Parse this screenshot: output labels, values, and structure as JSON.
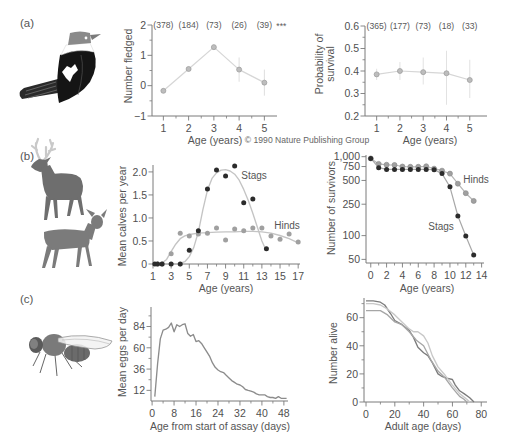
{
  "figure": {
    "panels": {
      "a": {
        "label": "(a)",
        "illustration": "bird-icon"
      },
      "b": {
        "label": "(b)",
        "illustration": "deer-icon"
      },
      "c": {
        "label": "(c)",
        "illustration": "fruit-fly-icon"
      }
    },
    "copyright": "© 1990 Nature Publishing Group"
  },
  "chart_data": [
    {
      "id": "a1",
      "panel": "(a)",
      "type": "line",
      "title": "",
      "xlabel": "Age (years)",
      "ylabel": "Number fledged",
      "xlim": [
        0.55,
        5.5
      ],
      "ylim": [
        -1,
        2
      ],
      "grid": false,
      "xticks": [
        1,
        2,
        3,
        4,
        5
      ],
      "xtick_labels": [
        "1",
        "2",
        "3",
        "4",
        "5"
      ],
      "xticks_minor": [
        1.5,
        2.5,
        3.5,
        4.5
      ],
      "yticks": [
        -1,
        0,
        1,
        2
      ],
      "ytick_labels": [
        "−1",
        "0",
        "1",
        "2"
      ],
      "yticks_minor": [
        -0.5,
        0.5,
        1.5
      ],
      "series": [
        {
          "name": "Number fledged",
          "mode": "line+markers",
          "x": [
            1,
            2,
            3,
            4,
            5
          ],
          "values": [
            -0.17,
            0.55,
            1.27,
            0.53,
            0.1
          ],
          "err_low": [
            -0.24,
            0.48,
            1.18,
            0.13,
            -0.33
          ],
          "err_high": [
            -0.1,
            0.62,
            1.36,
            0.93,
            0.53
          ],
          "color": "#d6d6d6",
          "marker_color": "#bdbdbd",
          "marker_edge": "#9a9a9a",
          "err_color": "#dedede"
        }
      ],
      "annotations": {
        "sample_sizes": [
          "(378)",
          "(184)",
          "(73)",
          "(26)",
          "(39)"
        ],
        "significance": "***"
      }
    },
    {
      "id": "a2",
      "panel": "(a)",
      "type": "line",
      "title": "",
      "xlabel": "Age (years)",
      "ylabel": "Probability of\nsurvival",
      "xlim": [
        0.5,
        5.74
      ],
      "ylim": [
        0.2,
        0.6
      ],
      "grid": false,
      "xticks": [
        1,
        2,
        3,
        4,
        5
      ],
      "xtick_labels": [
        "1",
        "2",
        "3",
        "4",
        "5"
      ],
      "xticks_minor": [
        1.5,
        2.5,
        3.5,
        4.5
      ],
      "yticks": [
        0.2,
        0.3,
        0.4,
        0.5,
        0.6
      ],
      "ytick_labels": [
        "0.2",
        "0.3",
        "0.4",
        "0.5",
        "0.6"
      ],
      "yticks_minor": [
        0.25,
        0.35,
        0.45,
        0.55
      ],
      "series": [
        {
          "name": "Probability of survival",
          "mode": "line+markers",
          "x": [
            1,
            2,
            3,
            4,
            5
          ],
          "values": [
            0.385,
            0.4,
            0.395,
            0.39,
            0.36
          ],
          "err_low": [
            0.36,
            0.36,
            0.34,
            0.25,
            0.28
          ],
          "err_high": [
            0.41,
            0.44,
            0.46,
            0.49,
            0.45
          ],
          "color": "#d6d6d6",
          "marker_color": "#bdbdbd",
          "marker_edge": "#9a9a9a",
          "err_color": "#e2e2e2"
        }
      ],
      "annotations": {
        "sample_sizes": [
          "(365)",
          "(177)",
          "(73)",
          "(18)",
          "(33)"
        ]
      }
    },
    {
      "id": "b1",
      "panel": "(b)",
      "type": "scatter",
      "title": "",
      "xlabel": "Age (years)",
      "ylabel": "Mean calves per year",
      "xlim": [
        1,
        17.2
      ],
      "ylim": [
        0,
        2.15
      ],
      "grid": false,
      "xticks": [
        1,
        3,
        5,
        7,
        9,
        11,
        13,
        15,
        17
      ],
      "xtick_labels": [
        "1",
        "3",
        "5",
        "7",
        "9",
        "11",
        "13",
        "15",
        "17"
      ],
      "xticks_minor": [
        2,
        4,
        6,
        8,
        10,
        12,
        14,
        16
      ],
      "yticks": [
        0,
        0.5,
        1,
        1.5,
        2
      ],
      "ytick_labels": [
        "0",
        "0.5",
        "1.0",
        "1.5",
        "2.0"
      ],
      "series": [
        {
          "name": "Stags fit",
          "mode": "line",
          "x": [
            3.8,
            4.5,
            5,
            5.5,
            6,
            6.5,
            7,
            7.5,
            8,
            8.5,
            9,
            9.5,
            10,
            10.5,
            11,
            11.5,
            12,
            12.5,
            13,
            13.5
          ],
          "values": [
            0,
            0.05,
            0.16,
            0.36,
            0.7,
            1.18,
            1.6,
            1.86,
            1.98,
            2.04,
            2.05,
            2.02,
            1.95,
            1.82,
            1.62,
            1.38,
            1.1,
            0.8,
            0.5,
            0.28
          ],
          "color": "#c4c4c4"
        },
        {
          "name": "Hinds fit",
          "mode": "line",
          "x": [
            1,
            2,
            2.5,
            3,
            3.5,
            4,
            4.5,
            5,
            6,
            7,
            8,
            9,
            10,
            11,
            12,
            13,
            14,
            15,
            16,
            17
          ],
          "values": [
            0,
            0.02,
            0.1,
            0.27,
            0.43,
            0.55,
            0.61,
            0.64,
            0.67,
            0.68,
            0.69,
            0.7,
            0.7,
            0.71,
            0.71,
            0.7,
            0.67,
            0.62,
            0.55,
            0.46
          ],
          "color": "#c4c4c4"
        },
        {
          "name": "Hinds",
          "mode": "markers",
          "x": [
            1.5,
            2,
            3,
            4,
            5,
            6,
            7,
            8,
            9,
            10,
            11,
            12,
            13,
            14,
            15,
            16,
            17
          ],
          "values": [
            0,
            0,
            0.22,
            0.67,
            0.61,
            0.65,
            0.67,
            0.78,
            0.52,
            0.76,
            0.72,
            0.78,
            0.78,
            0.61,
            0.54,
            0.65,
            0.48
          ],
          "marker_color": "#a0a0a0"
        },
        {
          "name": "Stags",
          "mode": "markers",
          "x": [
            1.2,
            1.5,
            2,
            3,
            4,
            5,
            6,
            7,
            8,
            9,
            10,
            11,
            12,
            13.5
          ],
          "values": [
            0,
            0,
            0,
            0,
            0,
            0.3,
            0.72,
            1.63,
            2.04,
            1.91,
            2.13,
            1.33,
            1.41,
            0.33
          ],
          "marker_color": "#2b2b2b"
        }
      ],
      "annotations": {
        "series_labels": [
          "Stags",
          "Hinds"
        ]
      }
    },
    {
      "id": "b2",
      "panel": "(b)",
      "type": "line",
      "title": "",
      "xlabel": "Age (years)",
      "ylabel": "Number of survivors",
      "yscale": "log",
      "xlim": [
        -0.6,
        14.3
      ],
      "ylim": [
        45,
        1050
      ],
      "grid": false,
      "xticks": [
        0,
        2,
        4,
        6,
        8,
        10,
        12,
        14
      ],
      "xtick_labels": [
        "0",
        "2",
        "4",
        "6",
        "8",
        "10",
        "12",
        "14"
      ],
      "xticks_minor": [
        1,
        3,
        5,
        7,
        9,
        11,
        13
      ],
      "yticks": [
        50,
        100,
        250,
        500,
        750,
        1000
      ],
      "ytick_labels": [
        "50",
        "100",
        "250",
        "500",
        "750",
        "1,000"
      ],
      "series": [
        {
          "name": "Hinds",
          "mode": "line+markers",
          "x": [
            0,
            1,
            2,
            3,
            4,
            5,
            6,
            7,
            8,
            9,
            10,
            11,
            12,
            13
          ],
          "values": [
            950,
            810,
            790,
            785,
            750,
            745,
            745,
            755,
            705,
            665,
            610,
            455,
            345,
            275
          ],
          "color": "#b5b5b5",
          "marker_color": "#a0a0a0",
          "marker_edge": "#8c8c8c"
        },
        {
          "name": "Stags",
          "mode": "line+markers",
          "x": [
            0,
            1,
            2,
            3,
            4,
            5,
            6,
            7,
            8,
            9,
            10,
            11,
            12,
            13
          ],
          "values": [
            950,
            725,
            690,
            690,
            690,
            690,
            690,
            690,
            685,
            610,
            415,
            177,
            99,
            57
          ],
          "color": "#a8a8a8",
          "marker_color": "#2b2b2b"
        }
      ],
      "annotations": {
        "series_labels": [
          "Hinds",
          "Stags"
        ]
      }
    },
    {
      "id": "c1",
      "panel": "(c)",
      "type": "line",
      "title": "",
      "xlabel": "Age from start of assay (days)",
      "ylabel": "Mean eggs per day",
      "xlim": [
        -0.4,
        49.5
      ],
      "ylim": [
        0,
        106
      ],
      "grid": false,
      "xticks": [
        0,
        8,
        16,
        24,
        32,
        40,
        48
      ],
      "xtick_labels": [
        "0",
        "8",
        "16",
        "24",
        "32",
        "40",
        "48"
      ],
      "xticks_minor": [
        4,
        12,
        20,
        28,
        36,
        44
      ],
      "yticks": [
        12,
        36,
        60,
        84
      ],
      "ytick_labels": [
        "12",
        "36",
        "60",
        "84"
      ],
      "yticks_minor": [
        24,
        48,
        72,
        96
      ],
      "series": [
        {
          "name": "Mean eggs per day",
          "mode": "line",
          "x": [
            1,
            2,
            3,
            4,
            5,
            6,
            7,
            8,
            9,
            10,
            11,
            12,
            13,
            14,
            15,
            16,
            17,
            18,
            19,
            20,
            21,
            22,
            23,
            24,
            25,
            26,
            27,
            28,
            29,
            30,
            31,
            32,
            33,
            34,
            35,
            36,
            37,
            38,
            39,
            40,
            41,
            42,
            43,
            44,
            45,
            46,
            47,
            48,
            49
          ],
          "values": [
            5,
            42,
            70,
            80,
            81,
            83,
            88,
            78,
            86,
            84,
            86,
            87,
            76,
            73,
            75,
            67,
            68,
            65,
            60,
            55,
            50,
            43,
            38,
            35,
            33,
            32,
            29,
            26,
            23,
            21,
            19,
            18,
            16,
            13,
            12,
            11,
            10,
            8,
            7,
            7,
            7,
            5,
            4,
            4,
            3,
            5,
            3,
            3,
            3
          ],
          "color": "#8c8c8c"
        }
      ]
    },
    {
      "id": "c2",
      "panel": "(c)",
      "type": "line",
      "title": "",
      "xlabel": "Adult age (days)",
      "ylabel": "Number alive",
      "xlim": [
        -1.4,
        84
      ],
      "ylim": [
        0,
        74
      ],
      "grid": false,
      "xticks": [
        0,
        20,
        40,
        60,
        80
      ],
      "xtick_labels": [
        "0",
        "20",
        "40",
        "60",
        "80"
      ],
      "xticks_minor": [
        10,
        30,
        50,
        70
      ],
      "yticks": [
        0,
        20,
        40,
        60
      ],
      "ytick_labels": [
        "0",
        "20",
        "40",
        "60"
      ],
      "yticks_minor": [
        10,
        30,
        50,
        70
      ],
      "series": [
        {
          "name": "series 1",
          "mode": "line",
          "x": [
            0,
            5,
            10,
            13,
            17,
            20,
            25,
            30,
            33,
            36,
            40,
            43,
            46,
            50,
            53,
            56,
            60,
            62,
            65,
            68,
            72,
            75
          ],
          "values": [
            72,
            72,
            71,
            69,
            63,
            58,
            55,
            51,
            46,
            39,
            35,
            33,
            28,
            20,
            18,
            17,
            16,
            12,
            8,
            6,
            3,
            0
          ],
          "color": "#7c7c7c"
        },
        {
          "name": "series 2",
          "mode": "line",
          "x": [
            0,
            5,
            10,
            15,
            20,
            25,
            30,
            33,
            36,
            40,
            43,
            46,
            50,
            55,
            60,
            65,
            70,
            72
          ],
          "values": [
            70,
            70,
            69,
            66,
            62,
            57,
            52,
            50,
            50,
            47,
            42,
            33,
            25,
            19,
            12,
            6,
            2,
            0
          ],
          "color": "#c8c8c8"
        },
        {
          "name": "series 3",
          "mode": "line",
          "x": [
            0,
            5,
            10,
            15,
            20,
            25,
            30,
            35,
            40,
            45,
            50,
            55,
            60,
            65,
            68,
            70
          ],
          "values": [
            65,
            65,
            65,
            62,
            57,
            55,
            50,
            44,
            40,
            30,
            22,
            17,
            10,
            4,
            2,
            0
          ],
          "color": "#a6a6a6"
        }
      ]
    }
  ]
}
